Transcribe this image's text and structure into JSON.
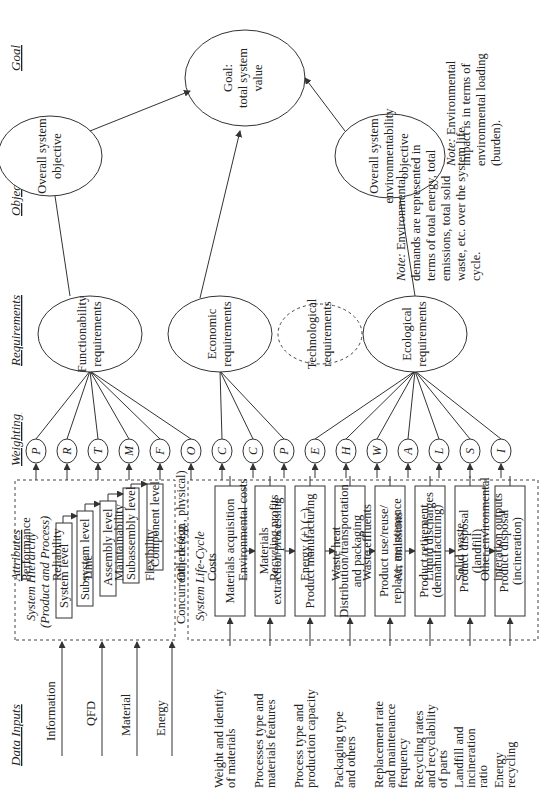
{
  "headers": {
    "data_inputs": "Data Inputs",
    "attributes": "Attributes",
    "weighting": "Weighting",
    "requirements": "Requirements",
    "objectives": "Objective(s)",
    "goal": "Goal"
  },
  "data_inputs": [
    "Information",
    "QFD",
    "Material",
    "Energy"
  ],
  "system_hierarchy": {
    "title1": "System Hierarchy",
    "title2": "(Product and Process)",
    "levels": [
      "System level",
      "Subsystem level",
      "Assembly level",
      "Subassembly level",
      "Component level"
    ]
  },
  "concurrent_design": [
    "Concurrent",
    "design"
  ],
  "system_life_cycle": {
    "title": "System Life-Cycle",
    "stages": [
      [
        "Materials acquisition"
      ],
      [
        "Materials",
        "extraction/processing"
      ],
      [
        "Product manufacturing"
      ],
      [
        "Distribution/transportation",
        "and packaging"
      ],
      [
        "Product use/reuse/",
        "replace, maintenance"
      ],
      [
        "Product retirement",
        "(demanufacturing)"
      ],
      [
        "Product disposal",
        "(landfill)"
      ],
      [
        "Product disposal",
        "(incineration)"
      ]
    ],
    "inputs": [
      [
        "Weight and identify",
        "of materials"
      ],
      [
        "Processes type and",
        "materials features"
      ],
      [
        "Process type and",
        "production capacity"
      ],
      [
        "Packaging type",
        "and others"
      ],
      [
        "Replacement rate",
        "and maintenance",
        "frequency"
      ],
      [
        "Recycling rates",
        "and recyclability",
        "of parts"
      ],
      [
        "Landfill and",
        "incineration",
        "ratio"
      ],
      [
        "Energy",
        "recycling"
      ]
    ]
  },
  "attributes": [
    {
      "label": [
        "Performance"
      ],
      "weight": "P"
    },
    {
      "label": [
        "Reliability"
      ],
      "weight": "R"
    },
    {
      "label": [
        "Time"
      ],
      "weight": "T"
    },
    {
      "label": [
        "Maintainability"
      ],
      "weight": "M"
    },
    {
      "label": [
        "Flexibility"
      ],
      "weight": "F"
    },
    {
      "label": [
        "Others (e.g., physical)"
      ],
      "weight": "O"
    },
    {
      "label": [
        "Costs"
      ],
      "weight": "C"
    },
    {
      "label": [
        "Environmental costs"
      ],
      "weight": "C"
    },
    {
      "label": [
        "Recycling profits"
      ],
      "weight": "P"
    },
    {
      "label": [
        "Energy (+) (−)"
      ],
      "weight": "E"
    },
    {
      "label": [
        "Waste heat"
      ],
      "weight": "H"
    },
    {
      "label": [
        "Waste effluents"
      ],
      "weight": "W"
    },
    {
      "label": [
        "Air emissions"
      ],
      "weight": "A"
    },
    {
      "label": [
        "Liquid discharges"
      ],
      "weight": "L"
    },
    {
      "label": [
        "Solid waste"
      ],
      "weight": "S"
    },
    {
      "label": [
        "Other environmental",
        "interation outputs"
      ],
      "weight": "I"
    }
  ],
  "requirements": {
    "functionability": [
      "Functionability",
      "requirements"
    ],
    "economic": [
      "Economic",
      "requirements"
    ],
    "technological": [
      "Technological",
      "requirements"
    ],
    "ecological": [
      "Ecological",
      "requirements"
    ]
  },
  "objectives": {
    "overall": [
      "Overall system",
      "objective"
    ],
    "environmental": [
      "Overall system",
      "environmentability",
      "objective"
    ]
  },
  "goal": [
    "Goal:",
    "total system",
    "value"
  ],
  "notes": {
    "ecological_prefix": "Note:",
    "ecological": [
      " Environmental",
      "demands are represented in",
      "terms of total energy, total",
      "emissions, total solid",
      "waste, etc. over the system life",
      "cycle."
    ],
    "impact_prefix": "Note:",
    "impact": [
      " Environmental",
      "impact is in terms of",
      "environmental loading",
      "(burden)."
    ]
  }
}
